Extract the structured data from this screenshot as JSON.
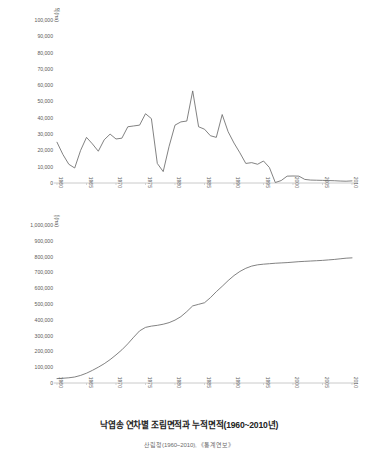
{
  "figure": {
    "title": "낙엽송 연차별 조림면적과 누적면적(1960~2010년)",
    "source": "산림청(1960~2010), 《통계연보》"
  },
  "chart_data": [
    {
      "id": "annual",
      "type": "line",
      "title": "",
      "xlabel": "",
      "ylabel": "낙엽송 조림면적(ha)",
      "xlim": [
        1960,
        2010
      ],
      "ylim": [
        0,
        100000
      ],
      "grid": false,
      "legend": false,
      "ytick_labels": [
        "100,000",
        "90,000",
        "80,000",
        "70,000",
        "60,000",
        "50,000",
        "40,000",
        "30,000",
        "20,000",
        "10,000",
        "0"
      ],
      "ytick_values": [
        100000,
        90000,
        80000,
        70000,
        60000,
        50000,
        40000,
        30000,
        20000,
        10000,
        0
      ],
      "xtick_labels": [
        "1960",
        "1965",
        "1970",
        "1975",
        "1980",
        "1985",
        "1990",
        "1995",
        "2000",
        "2005",
        "2010"
      ],
      "xtick_values": [
        1960,
        1965,
        1970,
        1975,
        1980,
        1985,
        1990,
        1995,
        2000,
        2005,
        2010
      ],
      "x": [
        1960,
        1961,
        1962,
        1963,
        1964,
        1965,
        1966,
        1967,
        1968,
        1969,
        1970,
        1971,
        1972,
        1973,
        1974,
        1975,
        1976,
        1977,
        1978,
        1979,
        1980,
        1981,
        1982,
        1983,
        1984,
        1985,
        1986,
        1987,
        1988,
        1989,
        1990,
        1991,
        1992,
        1993,
        1994,
        1995,
        1996,
        1997,
        1998,
        1999,
        2000,
        2001,
        2002,
        2003,
        2004,
        2005,
        2006,
        2007,
        2008,
        2009,
        2010
      ],
      "values": [
        25000,
        17500,
        11500,
        9200,
        20000,
        28000,
        24000,
        19500,
        26500,
        30000,
        27000,
        27500,
        34500,
        35000,
        35500,
        42500,
        39500,
        12000,
        7000,
        22500,
        35500,
        37500,
        38000,
        56500,
        34500,
        33000,
        29000,
        28000,
        42000,
        31500,
        24500,
        18500,
        12000,
        12500,
        11500,
        13500,
        9500,
        300,
        1500,
        4200,
        4300,
        4200,
        2200,
        1800,
        1700,
        1600,
        1500,
        1400,
        1200,
        1100,
        1300
      ],
      "series": [
        {
          "name": "연차별 조림면적",
          "color": "#6b6b6b"
        }
      ]
    },
    {
      "id": "cumulative",
      "type": "line",
      "title": "",
      "xlabel": "",
      "ylabel": "낙엽송 누적면적(ha)",
      "xlim": [
        1960,
        2010
      ],
      "ylim": [
        0,
        1000000
      ],
      "grid": false,
      "legend": false,
      "ytick_labels": [
        "1,000,000",
        "900,000",
        "800,000",
        "700,000",
        "600,000",
        "500,000",
        "400,000",
        "300,000",
        "200,000",
        "100,000",
        "0"
      ],
      "ytick_values": [
        1000000,
        900000,
        800000,
        700000,
        600000,
        500000,
        400000,
        300000,
        200000,
        100000,
        0
      ],
      "xtick_labels": [
        "1960",
        "1965",
        "1970",
        "1975",
        "1980",
        "1985",
        "1990",
        "1995",
        "2000",
        "2005",
        "2010"
      ],
      "xtick_values": [
        1960,
        1965,
        1970,
        1975,
        1980,
        1985,
        1990,
        1995,
        2000,
        2005,
        2010
      ],
      "x": [
        1960,
        1961,
        1962,
        1963,
        1964,
        1965,
        1966,
        1967,
        1968,
        1969,
        1970,
        1971,
        1972,
        1973,
        1974,
        1975,
        1976,
        1977,
        1978,
        1979,
        1980,
        1981,
        1982,
        1983,
        1984,
        1985,
        1986,
        1987,
        1988,
        1989,
        1990,
        1991,
        1992,
        1993,
        1994,
        1995,
        1996,
        1997,
        1998,
        1999,
        2000,
        2001,
        2002,
        2003,
        2004,
        2005,
        2006,
        2007,
        2008,
        2009,
        2010
      ],
      "values": [
        25000,
        42500,
        54000,
        63200,
        83200,
        111200,
        135200,
        154700,
        181200,
        211200,
        238200,
        265700,
        300200,
        335200,
        370700,
        413200,
        452700,
        464700,
        471700,
        494200,
        529700,
        567200,
        605200,
        661700,
        696200,
        729200,
        758200,
        786200,
        828200,
        859700,
        884200,
        902700,
        914700,
        927200,
        938700,
        952200,
        961700,
        962000,
        963500,
        967700,
        972000,
        976200,
        978400,
        980200,
        981900,
        983500,
        985000,
        986400,
        987600,
        988700,
        990000
      ],
      "display_values": [
        28000,
        30000,
        33000,
        38000,
        48000,
        62000,
        80000,
        100000,
        122000,
        148000,
        178000,
        210000,
        248000,
        290000,
        330000,
        352000,
        360000,
        365000,
        372000,
        382000,
        398000,
        420000,
        452000,
        488000,
        498000,
        508000,
        540000,
        578000,
        612000,
        648000,
        680000,
        706000,
        726000,
        740000,
        748000,
        752000,
        755000,
        758000,
        760000,
        762000,
        765000,
        768000,
        770000,
        772000,
        774000,
        776000,
        779000,
        782000,
        786000,
        790000,
        792000
      ],
      "series": [
        {
          "name": "누적 조림면적",
          "color": "#6b6b6b"
        }
      ]
    }
  ]
}
